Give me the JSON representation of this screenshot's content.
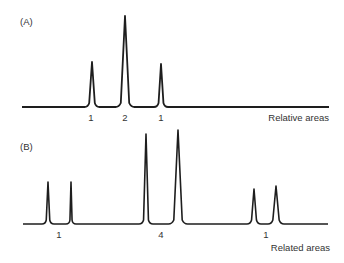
{
  "panels": [
    {
      "tag": "(A)",
      "caption": "Relative areas",
      "baseline_y": 107,
      "x_start": 22,
      "x_end": 329,
      "peaks": [
        {
          "x": 92,
          "top": 62,
          "half_width": 4
        },
        {
          "x": 125,
          "top": 16,
          "half_width": 6
        },
        {
          "x": 161,
          "top": 64,
          "half_width": 3.5
        }
      ],
      "area_labels": [
        {
          "text": "1",
          "x": 91
        },
        {
          "text": "2",
          "x": 125
        },
        {
          "text": "1",
          "x": 161
        }
      ]
    },
    {
      "tag": "(B)",
      "caption": "Related areas",
      "baseline_y": 224,
      "x_start": 23,
      "x_end": 328,
      "peaks": [
        {
          "x": 48,
          "top": 182,
          "half_width": 2.5
        },
        {
          "x": 71,
          "top": 182,
          "half_width": 1.5
        },
        {
          "x": 146,
          "top": 134,
          "half_width": 3.5
        },
        {
          "x": 178,
          "top": 130,
          "half_width": 6
        },
        {
          "x": 254,
          "top": 189,
          "half_width": 3.5
        },
        {
          "x": 276,
          "top": 186,
          "half_width": 4.5
        }
      ],
      "area_labels": [
        {
          "text": "1",
          "x": 59
        },
        {
          "text": "4",
          "x": 161
        },
        {
          "text": "1",
          "x": 266
        }
      ]
    }
  ],
  "colors": {
    "trace": "#1e1e1e",
    "text": "#333333",
    "background": "#ffffff"
  }
}
